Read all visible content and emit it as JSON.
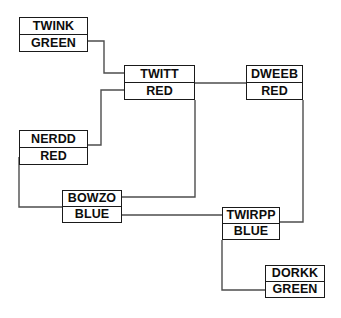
{
  "diagram": {
    "type": "node-link-graph",
    "canvas": {
      "width": 341,
      "height": 318,
      "background": "#ffffff"
    },
    "style": {
      "node_border": "#1a1a1a",
      "node_fill": "#ffffff",
      "edge_color": "#4d4d4d",
      "text_color": "#0d0d0d"
    },
    "nodes": [
      {
        "id": "twink",
        "name": "TWINK",
        "color_label": "GREEN",
        "x": 19,
        "y": 17,
        "width": 69,
        "height": 35
      },
      {
        "id": "twitt",
        "name": "TWITT",
        "color_label": "RED",
        "x": 124,
        "y": 65,
        "width": 71,
        "height": 35
      },
      {
        "id": "dweeb",
        "name": "DWEEB",
        "color_label": "RED",
        "x": 246,
        "y": 65,
        "width": 57,
        "height": 35
      },
      {
        "id": "nerdd",
        "name": "NERDD",
        "color_label": "RED",
        "x": 19,
        "y": 130,
        "width": 69,
        "height": 35
      },
      {
        "id": "bowzo",
        "name": "BOWZO",
        "color_label": "BLUE",
        "x": 62,
        "y": 190,
        "width": 60,
        "height": 33
      },
      {
        "id": "twirpp",
        "name": "TWIRPP",
        "color_label": "BLUE",
        "x": 222,
        "y": 207,
        "width": 58,
        "height": 33
      },
      {
        "id": "dorkk",
        "name": "DORKK",
        "color_label": "GREEN",
        "x": 265,
        "y": 265,
        "width": 60,
        "height": 33
      }
    ],
    "edges": [
      {
        "id": "twink-twitt",
        "from": "twink",
        "to": "twitt",
        "path": "M 88 41 H 104 V 73 H 124"
      },
      {
        "id": "nerdd-twitt",
        "from": "nerdd",
        "to": "twitt",
        "path": "M 88 145 H 101 V 90 H 124"
      },
      {
        "id": "twitt-dweeb",
        "from": "twitt",
        "to": "dweeb",
        "path": "M 195 83 H 246"
      },
      {
        "id": "twitt-bowzo",
        "from": "twitt",
        "to": "bowzo",
        "path": "M 195 100 V 197 H 122"
      },
      {
        "id": "nerdd-bowzo",
        "from": "nerdd",
        "to": "bowzo",
        "path": "M 19 157 V 207 H 62"
      },
      {
        "id": "bowzo-twirpp",
        "from": "bowzo",
        "to": "twirpp",
        "path": "M 122 215 H 222"
      },
      {
        "id": "dweeb-twirpp",
        "from": "dweeb",
        "to": "twirpp",
        "path": "M 303 100 V 222 H 280"
      },
      {
        "id": "twirpp-dorkk",
        "from": "twirpp",
        "to": "dorkk",
        "path": "M 222 240 V 290 H 265"
      }
    ]
  }
}
